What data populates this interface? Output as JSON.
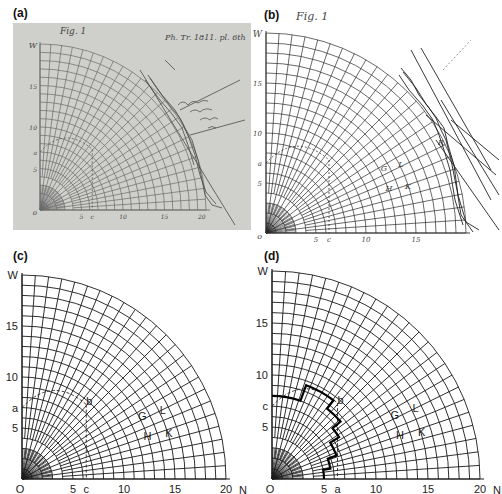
{
  "figure": {
    "panels": [
      {
        "id": "a",
        "label": "(a)",
        "kind": "photograph of original manuscript drawing",
        "caption_handwriting": "Fig. 1",
        "annotation_top_right": "Ph. Tr. 1811. pl. 6th",
        "annotation_margin": "illegible handwritten note",
        "axis_labels": {
          "vertical_top": "W",
          "origin": "O",
          "horizontal_end": "N"
        },
        "tick_labels_vertical": [
          "15",
          "10",
          "a",
          "5"
        ],
        "tick_labels_horizontal": [
          "5",
          "c",
          "10",
          "15",
          "20"
        ],
        "point_labels": [
          "b",
          "G",
          "L",
          "H",
          "K",
          "R"
        ]
      },
      {
        "id": "b",
        "label": "(b)",
        "kind": "engraved published figure",
        "caption_handwriting": "Fig. 1",
        "axis_labels": {
          "vertical_top": "W",
          "origin": "O",
          "horizontal_end": "N"
        },
        "tick_labels_vertical": [
          "15",
          "10",
          "a",
          "5"
        ],
        "tick_labels_horizontal": [
          "5",
          "c",
          "10",
          "15"
        ],
        "point_labels": [
          "b",
          "G",
          "L",
          "H",
          "K",
          "R"
        ]
      },
      {
        "id": "c",
        "label": "(c)",
        "kind": "redrawn polar grid",
        "axis_labels": {
          "vertical_top": "W",
          "origin": "O",
          "horizontal_end": "N"
        },
        "tick_labels_vertical": [
          {
            "text": "15",
            "value": 15
          },
          {
            "text": "10",
            "value": 10
          },
          {
            "text": "a",
            "value": 7
          },
          {
            "text": "5",
            "value": 5
          }
        ],
        "tick_labels_horizontal": [
          {
            "text": "5",
            "value": 5
          },
          {
            "text": "c",
            "value": 6.3
          },
          {
            "text": "10",
            "value": 10
          },
          {
            "text": "15",
            "value": 15
          },
          {
            "text": "20",
            "value": 20
          }
        ],
        "point_labels": [
          {
            "text": "b",
            "x": 6.6,
            "y": 7.6
          },
          {
            "text": "G",
            "x": 11.8,
            "y": 6.2
          },
          {
            "text": "L",
            "x": 13.8,
            "y": 6.8
          },
          {
            "text": "H",
            "x": 12.3,
            "y": 4.2
          },
          {
            "text": "K",
            "x": 14.4,
            "y": 4.5
          }
        ],
        "dashed_arc": {
          "from": [
            0,
            7
          ],
          "to": [
            6.3,
            7.3
          ],
          "radius": 9.6
        },
        "dashed_vertical": {
          "x": 6.3,
          "from_y": 7.3,
          "to_y": 0
        }
      },
      {
        "id": "d",
        "label": "(d)",
        "kind": "redrawn polar grid with stepped boundary",
        "axis_labels": {
          "vertical_top": "W",
          "origin": "O",
          "horizontal_end": "N"
        },
        "tick_labels_vertical": [
          {
            "text": "15",
            "value": 15
          },
          {
            "text": "10",
            "value": 10
          },
          {
            "text": "c",
            "value": 7
          },
          {
            "text": "5",
            "value": 5
          }
        ],
        "tick_labels_horizontal": [
          {
            "text": "5",
            "value": 5
          },
          {
            "text": "a",
            "value": 6.3
          },
          {
            "text": "10",
            "value": 10
          },
          {
            "text": "15",
            "value": 15
          },
          {
            "text": "20",
            "value": 20
          }
        ],
        "point_labels": [
          {
            "text": "b",
            "x": 6.6,
            "y": 7.6
          },
          {
            "text": "G",
            "x": 11.8,
            "y": 6.2
          },
          {
            "text": "L",
            "x": 13.8,
            "y": 6.8
          },
          {
            "text": "H",
            "x": 12.3,
            "y": 4.2
          },
          {
            "text": "K",
            "x": 14.4,
            "y": 4.5
          }
        ],
        "stepped_path_polar": [
          [
            8.0,
            90
          ],
          [
            8.0,
            70
          ],
          [
            9.6,
            70
          ],
          [
            9.6,
            52
          ],
          [
            8.6,
            52
          ],
          [
            8.6,
            40
          ],
          [
            7.6,
            40
          ],
          [
            7.6,
            32
          ],
          [
            6.6,
            32
          ],
          [
            6.6,
            20
          ],
          [
            5.7,
            20
          ],
          [
            5.7,
            10
          ],
          [
            5.0,
            10
          ],
          [
            5.0,
            0
          ]
        ],
        "dashed_arc": {
          "from": [
            0,
            7
          ],
          "to": [
            6.3,
            7.3
          ],
          "radius": 9.6
        },
        "dashed_vertical": {
          "x": 6.3,
          "from_y": 7.3,
          "to_y": 0
        }
      }
    ]
  },
  "grid": {
    "max_radius": 20,
    "arc_count": 20,
    "radial_sets": [
      {
        "step_deg": 15,
        "start_r": 0
      },
      {
        "step_deg": 7.5,
        "start_r": 2
      },
      {
        "step_deg": 3.75,
        "start_r": 4
      }
    ],
    "line_color": "#1a1a1a",
    "sketch_color": "#555555",
    "photo_bg": "#cfcfcb"
  }
}
